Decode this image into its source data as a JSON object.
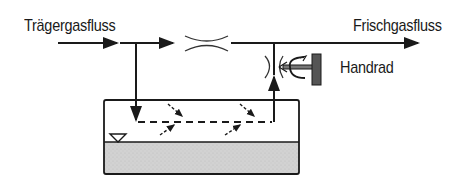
{
  "diagram": {
    "labels": {
      "carrier_gas_flow": "Trägergasfluss",
      "fresh_gas_flow": "Frischgasfluss",
      "handwheel": "Handrad"
    },
    "colors": {
      "line": "#1a1a1a",
      "liquid_fill": "#cfcfcf",
      "background": "#ffffff"
    },
    "components": [
      "carrier-gas-inlet-arrow",
      "main-flow-line",
      "bypass-throttle",
      "vaporizer-chamber",
      "liquid-anesthetic",
      "liquid-level-marker",
      "vapor-return-pipe",
      "control-valve",
      "handwheel",
      "fresh-gas-outlet-arrow"
    ]
  }
}
